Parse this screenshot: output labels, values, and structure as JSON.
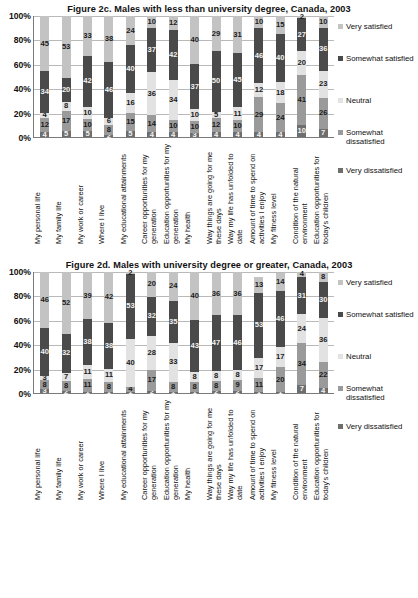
{
  "charts": [
    {
      "id": "figure-2c",
      "title": "Figure 2c.  Males with less than university degree, Canada, 2003",
      "chart_data": {
        "type": "bar",
        "stacked": true,
        "title": "Figure 2c.  Males with less than university degree, Canada, 2003",
        "xlabel": "",
        "ylabel": "",
        "ylim": [
          0,
          100
        ],
        "yticks": [
          "0%",
          "20%",
          "40%",
          "60%",
          "80%",
          "100%"
        ],
        "grid": true,
        "legend_position": "right",
        "categories": [
          "My personal life",
          "My family life",
          "My work or career",
          "Where I live",
          "My educational attainments",
          "Career opportunities for my generation",
          "Education opportunities for my generation",
          "My health",
          "Way things are going for me these days",
          "Way my life has unfolded to date",
          "Amount of time to spend on activities I enjoy",
          "My fitness level",
          "Condition of the natural environment",
          "Education opportunities for today's children"
        ],
        "series": [
          {
            "name": "Very dissatisfied",
            "values": [
              4,
              5,
              5,
              2,
              5,
              4,
              4,
              3,
              4,
              4,
              4,
              4,
              10,
              7
            ]
          },
          {
            "name": "Somewhat dissatisfied",
            "values": [
              12,
              17,
              10,
              8,
              15,
              14,
              10,
              10,
              12,
              10,
              29,
              24,
              41,
              26
            ]
          },
          {
            "name": "Neutral",
            "values": [
              4,
              8,
              10,
              6,
              16,
              36,
              34,
              10,
              5,
              11,
              12,
              18,
              20,
              23
            ]
          },
          {
            "name": "Somewhat satisfied",
            "values": [
              34,
              20,
              42,
              46,
              40,
              37,
              42,
              37,
              50,
              45,
              46,
              40,
              27,
              36
            ]
          },
          {
            "name": "Very satisfied",
            "values": [
              45,
              53,
              33,
              38,
              24,
              10,
              12,
              40,
              29,
              31,
              10,
              15,
              2,
              10
            ]
          }
        ],
        "legend": [
          "Very satisfied",
          "Somewhat satisfied",
          "Neutral",
          "Somewhat dissatisfied",
          "Very dissatisfied"
        ],
        "colors": [
          "#c3c3c3",
          "#4a4a4a",
          "#e2e2e2",
          "#9a9a9a",
          "#6e6e6e"
        ]
      }
    },
    {
      "id": "figure-2d",
      "title": "Figure 2d.  Males with university degree or greater, Canada,  2003",
      "chart_data": {
        "type": "bar",
        "stacked": true,
        "title": "Figure 2d.  Males with university degree or greater, Canada,  2003",
        "xlabel": "",
        "ylabel": "",
        "ylim": [
          0,
          100
        ],
        "yticks": [
          "0%",
          "20%",
          "40%",
          "60%",
          "80%",
          "100%"
        ],
        "grid": true,
        "legend_position": "right",
        "categories": [
          "My personal life",
          "My family life",
          "My work or career",
          "Where I live",
          "My educational attainments",
          "Career opportunities for my generation",
          "Education opportunities for my generation",
          "My health",
          "Way things are going for me these days",
          "Way my life has unfolded to date",
          "Amount of time to spend on activities I enjoy",
          "My fitness level",
          "Condition of the natural environment",
          "Education opportunities for today's children"
        ],
        "series": [
          {
            "name": "Very dissatisfied",
            "values": [
              3,
              2,
              1,
              1,
              1,
              2,
              1,
              1,
              2,
              2,
              1,
              1,
              7,
              4
            ]
          },
          {
            "name": "Somewhat dissatisfied",
            "values": [
              8,
              8,
              11,
              8,
              4,
              17,
              8,
              8,
              8,
              9,
              11,
              20,
              34,
              22
            ]
          },
          {
            "name": "Neutral",
            "values": [
              3,
              7,
              11,
              11,
              40,
              28,
              33,
              8,
              8,
              8,
              17,
              17,
              24,
              36
            ]
          },
          {
            "name": "Somewhat satisfied",
            "values": [
              40,
              32,
              38,
              38,
              53,
              32,
              35,
              43,
              47,
              46,
              53,
              46,
              31,
              30
            ]
          },
          {
            "name": "Very satisfied",
            "values": [
              46,
              52,
              39,
              42,
              2,
              20,
              24,
              40,
              36,
              36,
              13,
              14,
              4,
              8
            ]
          }
        ],
        "legend": [
          "Very satisfied",
          "Somewhat satisfied",
          "Neutral",
          "Somewhat dissatisfied",
          "Very dissatisfied"
        ],
        "colors": [
          "#c3c3c3",
          "#4a4a4a",
          "#e2e2e2",
          "#9a9a9a",
          "#6e6e6e"
        ]
      }
    }
  ]
}
